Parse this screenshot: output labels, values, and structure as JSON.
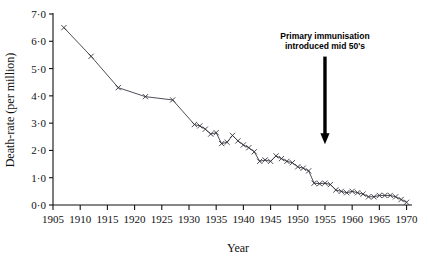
{
  "chart_data": {
    "type": "line",
    "title": "",
    "xlabel": "Year",
    "ylabel": "Death-rate (per million)",
    "xlim": [
      1905,
      1971
    ],
    "ylim": [
      0,
      7
    ],
    "grid": false,
    "legend": "none",
    "marker": "x",
    "xticks": [
      1905,
      1910,
      1915,
      1920,
      1925,
      1930,
      1935,
      1940,
      1945,
      1950,
      1955,
      1960,
      1965,
      1970
    ],
    "xtick_labels": [
      "1905",
      "1910",
      "1915",
      "1920",
      "1925",
      "1930",
      "1935",
      "1940",
      "1945",
      "1950",
      "1955",
      "1960",
      "1965",
      "1970"
    ],
    "yticks": [
      0,
      1,
      2,
      3,
      4,
      5,
      6,
      7
    ],
    "ytick_labels": [
      "0·0",
      "1·0",
      "2·0",
      "3·0",
      "4·0",
      "5·0",
      "6·0",
      "7·0"
    ],
    "x": [
      1907,
      1912,
      1917,
      1922,
      1927,
      1931,
      1932,
      1933,
      1934,
      1935,
      1936,
      1937,
      1938,
      1939,
      1940,
      1941,
      1942,
      1943,
      1944,
      1945,
      1946,
      1947,
      1948,
      1949,
      1950,
      1951,
      1952,
      1953,
      1954,
      1955,
      1956,
      1957,
      1958,
      1959,
      1960,
      1961,
      1962,
      1963,
      1964,
      1965,
      1966,
      1967,
      1968,
      1969,
      1970
    ],
    "y": [
      6.5,
      5.45,
      4.3,
      3.97,
      3.85,
      2.95,
      2.9,
      2.78,
      2.6,
      2.65,
      2.25,
      2.3,
      2.55,
      2.35,
      2.2,
      2.1,
      1.95,
      1.6,
      1.65,
      1.6,
      1.8,
      1.7,
      1.6,
      1.55,
      1.4,
      1.35,
      1.25,
      0.8,
      0.78,
      0.8,
      0.75,
      0.55,
      0.5,
      0.45,
      0.5,
      0.45,
      0.4,
      0.3,
      0.3,
      0.35,
      0.35,
      0.35,
      0.3,
      0.2,
      0.1
    ],
    "annotations": [
      {
        "name": "primary-immunisation-note",
        "line1": "Primary immunisation",
        "line2": "introduced mid 50's",
        "arrow_at_year": 1955,
        "arrow_from_value": 5.0,
        "arrow_to_value": 2.3
      }
    ]
  }
}
